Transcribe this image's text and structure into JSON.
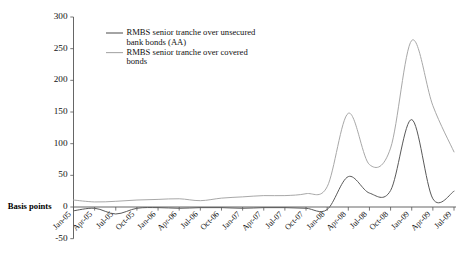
{
  "chart_data": {
    "type": "line",
    "title": "",
    "xlabel": "",
    "ylabel": "Basis points",
    "ylim": [
      -50,
      300
    ],
    "yticks": [
      -50,
      0,
      50,
      100,
      150,
      200,
      250,
      300
    ],
    "ytick_labels": [
      "-50",
      "0",
      "50",
      "100",
      "150",
      "200",
      "250",
      "300"
    ],
    "grid": false,
    "legend_position": "top-left-inside",
    "categories": [
      "Jan-05",
      "Apr-05",
      "Jul-05",
      "Oct-05",
      "Jan-06",
      "Apr-06",
      "Jul-06",
      "Oct-06",
      "Jan-07",
      "Apr-07",
      "Jul-07",
      "Oct-07",
      "Jan-08",
      "Apr-08",
      "Jul-08",
      "Oct-08",
      "Jan-09",
      "Apr-09",
      "Jul-09"
    ],
    "series": [
      {
        "name": "RMBS senior tranche over unsecured bank bonds (AA)",
        "color": "#595959",
        "values": [
          -6,
          -2,
          -11,
          -2,
          -1,
          -2,
          -1,
          -1,
          -2,
          -1,
          -1,
          -2,
          -4,
          48,
          22,
          26,
          138,
          13,
          25
        ]
      },
      {
        "name": "RMBS senior tranche over covered bonds",
        "color": "#a8a8a8",
        "values": [
          11,
          8,
          9,
          11,
          12,
          13,
          10,
          14,
          16,
          18,
          18,
          21,
          32,
          148,
          67,
          93,
          263,
          160,
          87
        ]
      }
    ]
  },
  "legend": {
    "entries": [
      {
        "line1": "RMBS senior tranche over unsecured",
        "line2": "bank bonds (AA)",
        "color": "#595959"
      },
      {
        "line1": "RMBS senior tranche over covered",
        "line2": "bonds",
        "color": "#a8a8a8"
      }
    ]
  },
  "axis": {
    "ylabel": "Basis points"
  }
}
